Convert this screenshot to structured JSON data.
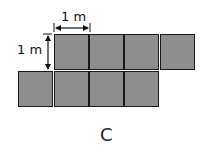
{
  "figure": {
    "caption": "C",
    "horizontal_label": "1 m",
    "vertical_label": "1 m",
    "square_color": "#8e8e8e",
    "top_row_squares": 4,
    "bottom_row_squares": 4
  }
}
